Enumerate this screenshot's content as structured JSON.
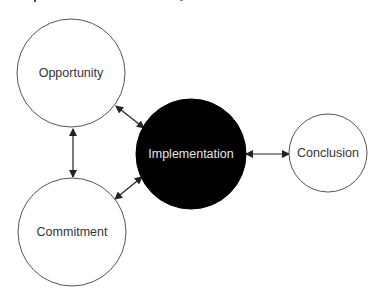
{
  "diagram": {
    "type": "cycle-flow",
    "colors": {
      "outline": "#555555",
      "filled_node": "#000000",
      "filled_text": "#e6e6e6",
      "text": "#333333",
      "arrow": "#222222",
      "background": "#ffffff"
    },
    "nodes": [
      {
        "id": "opportunity",
        "label": "Opportunity",
        "cx": 71,
        "cy": 73,
        "r": 54,
        "filled": false
      },
      {
        "id": "commitment",
        "label": "Commitment",
        "cx": 72,
        "cy": 232,
        "r": 54,
        "filled": false
      },
      {
        "id": "implementation",
        "label": "Implementation",
        "cx": 191,
        "cy": 154,
        "r": 55,
        "filled": true
      },
      {
        "id": "conclusion",
        "label": "Conclusion",
        "cx": 328,
        "cy": 153,
        "r": 39,
        "filled": false
      }
    ],
    "edges": [
      {
        "from": "opportunity",
        "to": "commitment",
        "bidirectional": true,
        "x1": 73,
        "y1": 129,
        "x2": 73,
        "y2": 177
      },
      {
        "from": "opportunity",
        "to": "implementation",
        "bidirectional": true,
        "x1": 116,
        "y1": 106,
        "x2": 144,
        "y2": 128
      },
      {
        "from": "commitment",
        "to": "implementation",
        "bidirectional": true,
        "x1": 115,
        "y1": 199,
        "x2": 142,
        "y2": 177
      },
      {
        "from": "implementation",
        "to": "conclusion",
        "bidirectional": true,
        "x1": 246,
        "y1": 154,
        "x2": 289,
        "y2": 154
      }
    ]
  }
}
